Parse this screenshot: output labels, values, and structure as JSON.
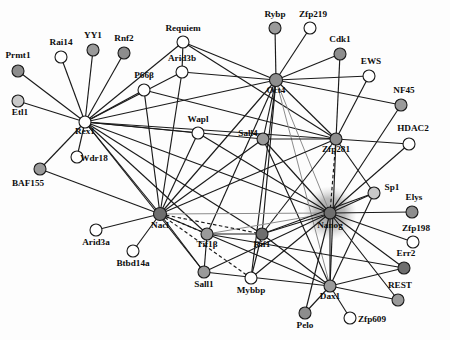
{
  "figure": {
    "type": "protein-interaction-network",
    "title": "",
    "background": "#fdfdfd",
    "edge_color": "#1a1a1a",
    "highlight_node": "Nanog",
    "highlight_halo_color": "#9e9e9e"
  },
  "legend": {
    "fills": {
      "white": "#ffffff",
      "light": "#c9c9c9",
      "medium": "#9a9a9a",
      "dark": "#6e6e6e"
    }
  },
  "nodes": [
    {
      "id": "Prmt1",
      "label": "Prmt1",
      "x": 18,
      "y": 71,
      "r": 6.0,
      "fill": "#8d8d8d",
      "lx": 18,
      "ly": 58,
      "anchor": "middle"
    },
    {
      "id": "Rai14",
      "label": "Rai14",
      "x": 61,
      "y": 57,
      "r": 6.0,
      "fill": "#ffffff",
      "lx": 61,
      "ly": 45,
      "anchor": "middle"
    },
    {
      "id": "YY1",
      "label": "YY1",
      "x": 93,
      "y": 50,
      "r": 6.0,
      "fill": "#9a9a9a",
      "lx": 93,
      "ly": 38,
      "anchor": "middle"
    },
    {
      "id": "Rnf2",
      "label": "Rnf2",
      "x": 124,
      "y": 53,
      "r": 6.0,
      "fill": "#8d8d8d",
      "lx": 124,
      "ly": 41,
      "anchor": "middle"
    },
    {
      "id": "Etl1",
      "label": "Etl1",
      "x": 18,
      "y": 101,
      "r": 6.0,
      "fill": "#c9c9c9",
      "lx": 20,
      "ly": 115,
      "anchor": "middle"
    },
    {
      "id": "Rex1",
      "label": "Rex1",
      "x": 85,
      "y": 122,
      "r": 6.0,
      "fill": "#ffffff",
      "lx": 85,
      "ly": 134,
      "anchor": "middle"
    },
    {
      "id": "Wdr18",
      "label": "Wdr18",
      "x": 77,
      "y": 157,
      "r": 6.0,
      "fill": "#ffffff",
      "lx": 94,
      "ly": 161,
      "anchor": "middle"
    },
    {
      "id": "BAF155",
      "label": "BAF155",
      "x": 40,
      "y": 169,
      "r": 6.0,
      "fill": "#9a9a9a",
      "lx": 28,
      "ly": 186,
      "anchor": "middle"
    },
    {
      "id": "Requiem",
      "label": "Requiem",
      "x": 183,
      "y": 42,
      "r": 6.0,
      "fill": "#ffffff",
      "lx": 183,
      "ly": 31,
      "anchor": "middle"
    },
    {
      "id": "Arid3b",
      "label": "Arid3b",
      "x": 182,
      "y": 72,
      "r": 6.0,
      "fill": "#ffffff",
      "lx": 182,
      "ly": 61,
      "anchor": "middle"
    },
    {
      "id": "P66b",
      "label": "P66β",
      "x": 144,
      "y": 90,
      "r": 6.0,
      "fill": "#ffffff",
      "lx": 144,
      "ly": 78,
      "anchor": "middle"
    },
    {
      "id": "Wapl",
      "label": "Wapl",
      "x": 198,
      "y": 133,
      "r": 6.0,
      "fill": "#ffffff",
      "lx": 198,
      "ly": 122,
      "anchor": "middle"
    },
    {
      "id": "Rybp",
      "label": "Rybp",
      "x": 275,
      "y": 28,
      "r": 6.0,
      "fill": "#9a9a9a",
      "lx": 275,
      "ly": 17,
      "anchor": "middle"
    },
    {
      "id": "Zfp219",
      "label": "Zfp219",
      "x": 310,
      "y": 28,
      "r": 6.0,
      "fill": "#ffffff",
      "lx": 313,
      "ly": 17,
      "anchor": "middle"
    },
    {
      "id": "Cdk1",
      "label": "Cdk1",
      "x": 340,
      "y": 54,
      "r": 6.0,
      "fill": "#8d8d8d",
      "lx": 340,
      "ly": 42,
      "anchor": "middle"
    },
    {
      "id": "EWS",
      "label": "EWS",
      "x": 369,
      "y": 76,
      "r": 6.0,
      "fill": "#ffffff",
      "lx": 371,
      "ly": 64,
      "anchor": "middle"
    },
    {
      "id": "NF45",
      "label": "NF45",
      "x": 401,
      "y": 105,
      "r": 6.0,
      "fill": "#9a9a9a",
      "lx": 404,
      "ly": 93,
      "anchor": "middle"
    },
    {
      "id": "HDAC2",
      "label": "HDAC2",
      "x": 409,
      "y": 144,
      "r": 6.0,
      "fill": "#ffffff",
      "lx": 413,
      "ly": 131,
      "anchor": "middle"
    },
    {
      "id": "Oct4",
      "label": "Oct4",
      "x": 276,
      "y": 80,
      "r": 6.5,
      "fill": "#8d8d8d",
      "lx": 276,
      "ly": 93,
      "anchor": "middle"
    },
    {
      "id": "Sall4",
      "label": "Sall4",
      "x": 263,
      "y": 139,
      "r": 6.0,
      "fill": "#9a9a9a",
      "lx": 248,
      "ly": 136,
      "anchor": "middle"
    },
    {
      "id": "Zfp281",
      "label": "Zfp281",
      "x": 336,
      "y": 139,
      "r": 6.0,
      "fill": "#8d8d8d",
      "lx": 336,
      "ly": 152,
      "anchor": "middle"
    },
    {
      "id": "Nanog",
      "label": "Nanog",
      "x": 330,
      "y": 213,
      "r": 6.0,
      "fill": "#6e6e6e",
      "lx": 330,
      "ly": 228,
      "anchor": "middle"
    },
    {
      "id": "Sp1",
      "label": "Sp1",
      "x": 374,
      "y": 193,
      "r": 6.0,
      "fill": "#c9c9c9",
      "lx": 392,
      "ly": 190,
      "anchor": "middle"
    },
    {
      "id": "Elys",
      "label": "Elys",
      "x": 412,
      "y": 212,
      "r": 6.0,
      "fill": "#8d8d8d",
      "lx": 414,
      "ly": 200,
      "anchor": "middle"
    },
    {
      "id": "Zfp198",
      "label": "Zfp198",
      "x": 413,
      "y": 242,
      "r": 6.0,
      "fill": "#ffffff",
      "lx": 416,
      "ly": 231,
      "anchor": "middle"
    },
    {
      "id": "Err2",
      "label": "Err2",
      "x": 404,
      "y": 268,
      "r": 6.0,
      "fill": "#6e6e6e",
      "lx": 406,
      "ly": 256,
      "anchor": "middle"
    },
    {
      "id": "REST",
      "label": "REST",
      "x": 398,
      "y": 300,
      "r": 6.0,
      "fill": "#9a9a9a",
      "lx": 400,
      "ly": 288,
      "anchor": "middle"
    },
    {
      "id": "Nacl",
      "label": "Nacl",
      "x": 160,
      "y": 214,
      "r": 6.5,
      "fill": "#6e6e6e",
      "lx": 160,
      "ly": 228,
      "anchor": "middle"
    },
    {
      "id": "Arid3a",
      "label": "Arid3a",
      "x": 96,
      "y": 230,
      "r": 6.0,
      "fill": "#ffffff",
      "lx": 96,
      "ly": 245,
      "anchor": "middle"
    },
    {
      "id": "Btbd14a",
      "label": "Btbd14a",
      "x": 133,
      "y": 251,
      "r": 6.0,
      "fill": "#ffffff",
      "lx": 133,
      "ly": 266,
      "anchor": "middle"
    },
    {
      "id": "Tif1b",
      "label": "Tif1β",
      "x": 207,
      "y": 234,
      "r": 6.0,
      "fill": "#9a9a9a",
      "lx": 207,
      "ly": 247,
      "anchor": "middle"
    },
    {
      "id": "Rif1",
      "label": "Rif1",
      "x": 262,
      "y": 234,
      "r": 6.0,
      "fill": "#6e6e6e",
      "lx": 262,
      "ly": 247,
      "anchor": "middle"
    },
    {
      "id": "Sall1",
      "label": "Sall1",
      "x": 204,
      "y": 272,
      "r": 6.0,
      "fill": "#9a9a9a",
      "lx": 204,
      "ly": 287,
      "anchor": "middle"
    },
    {
      "id": "Mybbp",
      "label": "Mybbp",
      "x": 251,
      "y": 278,
      "r": 6.0,
      "fill": "#ffffff",
      "lx": 251,
      "ly": 293,
      "anchor": "middle"
    },
    {
      "id": "Dax1",
      "label": "Dax1",
      "x": 330,
      "y": 286,
      "r": 6.0,
      "fill": "#9a9a9a",
      "lx": 330,
      "ly": 299,
      "anchor": "middle"
    },
    {
      "id": "Pelo",
      "label": "Pelo",
      "x": 305,
      "y": 313,
      "r": 6.0,
      "fill": "#8d8d8d",
      "lx": 305,
      "ly": 328,
      "anchor": "middle"
    },
    {
      "id": "Zfp609",
      "label": "Zfp609",
      "x": 350,
      "y": 318,
      "r": 6.0,
      "fill": "#ffffff",
      "lx": 372,
      "ly": 322,
      "anchor": "middle"
    }
  ],
  "edges": [
    {
      "s": "Prmt1",
      "t": "Rex1",
      "style": "solid"
    },
    {
      "s": "Rai14",
      "t": "Rex1",
      "style": "solid"
    },
    {
      "s": "YY1",
      "t": "Rex1",
      "style": "solid"
    },
    {
      "s": "Rnf2",
      "t": "Rex1",
      "style": "solid"
    },
    {
      "s": "Etl1",
      "t": "Rex1",
      "style": "solid"
    },
    {
      "s": "Wdr18",
      "t": "Rex1",
      "style": "solid"
    },
    {
      "s": "BAF155",
      "t": "Rex1",
      "style": "solid"
    },
    {
      "s": "Rex1",
      "t": "Requiem",
      "style": "solid"
    },
    {
      "s": "Rex1",
      "t": "Arid3b",
      "style": "solid"
    },
    {
      "s": "Rex1",
      "t": "P66b",
      "style": "solid"
    },
    {
      "s": "Rex1",
      "t": "Wapl",
      "style": "solid"
    },
    {
      "s": "Rex1",
      "t": "Oct4",
      "style": "solid"
    },
    {
      "s": "Rex1",
      "t": "Sall4",
      "style": "solid"
    },
    {
      "s": "Rex1",
      "t": "Zfp281",
      "style": "solid"
    },
    {
      "s": "Rex1",
      "t": "Nacl",
      "style": "solid"
    },
    {
      "s": "Rex1",
      "t": "Tif1b",
      "style": "solid"
    },
    {
      "s": "Rex1",
      "t": "Nanog",
      "style": "solid"
    },
    {
      "s": "Rex1",
      "t": "Rif1",
      "style": "solid"
    },
    {
      "s": "Rex1",
      "t": "Sall1",
      "style": "solid"
    },
    {
      "s": "Requiem",
      "t": "Oct4",
      "style": "solid"
    },
    {
      "s": "Requiem",
      "t": "Arid3b",
      "style": "solid"
    },
    {
      "s": "Requiem",
      "t": "Zfp281",
      "style": "solid"
    },
    {
      "s": "Arid3b",
      "t": "Oct4",
      "style": "solid"
    },
    {
      "s": "Arid3b",
      "t": "Nacl",
      "style": "solid"
    },
    {
      "s": "P66b",
      "t": "Zfp281",
      "style": "solid"
    },
    {
      "s": "P66b",
      "t": "Nacl",
      "style": "solid"
    },
    {
      "s": "Wapl",
      "t": "Nacl",
      "style": "solid"
    },
    {
      "s": "Wapl",
      "t": "Nanog",
      "style": "solid"
    },
    {
      "s": "Rybp",
      "t": "Oct4",
      "style": "solid"
    },
    {
      "s": "Zfp219",
      "t": "Oct4",
      "style": "solid"
    },
    {
      "s": "Cdk1",
      "t": "Oct4",
      "style": "solid"
    },
    {
      "s": "Cdk1",
      "t": "Zfp281",
      "style": "solid"
    },
    {
      "s": "EWS",
      "t": "Oct4",
      "style": "solid"
    },
    {
      "s": "EWS",
      "t": "Zfp281",
      "style": "solid"
    },
    {
      "s": "NF45",
      "t": "Oct4",
      "style": "solid"
    },
    {
      "s": "NF45",
      "t": "Nanog",
      "style": "solid"
    },
    {
      "s": "HDAC2",
      "t": "Zfp281",
      "style": "solid"
    },
    {
      "s": "HDAC2",
      "t": "Nanog",
      "style": "solid"
    },
    {
      "s": "Oct4",
      "t": "Sall4",
      "style": "solid"
    },
    {
      "s": "Oct4",
      "t": "Zfp281",
      "style": "solid"
    },
    {
      "s": "Oct4",
      "t": "Nacl",
      "style": "solid"
    },
    {
      "s": "Oct4",
      "t": "Nanog",
      "style": "gray"
    },
    {
      "s": "Oct4",
      "t": "Dax1",
      "style": "gray"
    },
    {
      "s": "Oct4",
      "t": "Rif1",
      "style": "solid"
    },
    {
      "s": "Oct4",
      "t": "Tif1b",
      "style": "solid"
    },
    {
      "s": "Oct4",
      "t": "Mybbp",
      "style": "solid"
    },
    {
      "s": "Sall4",
      "t": "Zfp281",
      "style": "solid"
    },
    {
      "s": "Sall4",
      "t": "Nanog",
      "style": "solid"
    },
    {
      "s": "Sall4",
      "t": "Dax1",
      "style": "solid"
    },
    {
      "s": "Sall4",
      "t": "Nacl",
      "style": "solid"
    },
    {
      "s": "Zfp281",
      "t": "Nanog",
      "style": "dashed"
    },
    {
      "s": "Zfp281",
      "t": "Nacl",
      "style": "solid"
    },
    {
      "s": "Zfp281",
      "t": "Dax1",
      "style": "solid"
    },
    {
      "s": "Zfp281",
      "t": "Rif1",
      "style": "solid"
    },
    {
      "s": "Zfp281",
      "t": "Sp1",
      "style": "solid"
    },
    {
      "s": "Nanog",
      "t": "Sp1",
      "style": "solid"
    },
    {
      "s": "Nanog",
      "t": "Elys",
      "style": "solid"
    },
    {
      "s": "Nanog",
      "t": "Zfp198",
      "style": "solid"
    },
    {
      "s": "Nanog",
      "t": "Err2",
      "style": "solid"
    },
    {
      "s": "Nanog",
      "t": "REST",
      "style": "solid"
    },
    {
      "s": "Nanog",
      "t": "Dax1",
      "style": "solid"
    },
    {
      "s": "Nanog",
      "t": "Rif1",
      "style": "solid"
    },
    {
      "s": "Nanog",
      "t": "Tif1b",
      "style": "gray"
    },
    {
      "s": "Nanog",
      "t": "Sall1",
      "style": "solid"
    },
    {
      "s": "Nanog",
      "t": "Mybbp",
      "style": "solid"
    },
    {
      "s": "Nanog",
      "t": "Nacl",
      "style": "gray"
    },
    {
      "s": "Nanog",
      "t": "Pelo",
      "style": "solid"
    },
    {
      "s": "Nacl",
      "t": "Arid3a",
      "style": "solid"
    },
    {
      "s": "Nacl",
      "t": "Btbd14a",
      "style": "solid"
    },
    {
      "s": "Nacl",
      "t": "Tif1b",
      "style": "dashed"
    },
    {
      "s": "Nacl",
      "t": "Rif1",
      "style": "dashed"
    },
    {
      "s": "Nacl",
      "t": "Sall1",
      "style": "solid"
    },
    {
      "s": "Nacl",
      "t": "Mybbp",
      "style": "dashed"
    },
    {
      "s": "Nacl",
      "t": "Dax1",
      "style": "solid"
    },
    {
      "s": "Nacl",
      "t": "BAF155",
      "style": "solid"
    },
    {
      "s": "Tif1b",
      "t": "Rif1",
      "style": "solid"
    },
    {
      "s": "Tif1b",
      "t": "Sall1",
      "style": "solid"
    },
    {
      "s": "Tif1b",
      "t": "Err2",
      "style": "solid"
    },
    {
      "s": "Rif1",
      "t": "Mybbp",
      "style": "solid"
    },
    {
      "s": "Rif1",
      "t": "Dax1",
      "style": "solid"
    },
    {
      "s": "Rif1",
      "t": "Sp1",
      "style": "solid"
    },
    {
      "s": "Dax1",
      "t": "Pelo",
      "style": "solid"
    },
    {
      "s": "Dax1",
      "t": "Zfp609",
      "style": "solid"
    },
    {
      "s": "Dax1",
      "t": "REST",
      "style": "solid"
    },
    {
      "s": "Dax1",
      "t": "Err2",
      "style": "solid"
    },
    {
      "s": "Dax1",
      "t": "Sp1",
      "style": "solid"
    },
    {
      "s": "Sall1",
      "t": "Dax1",
      "style": "solid"
    }
  ]
}
